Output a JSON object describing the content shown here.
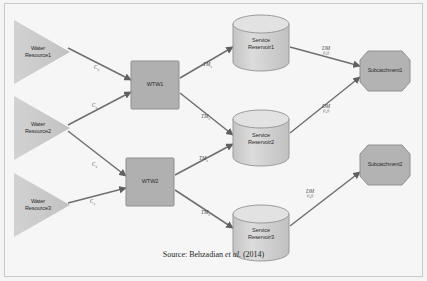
{
  "figure": {
    "caption_prefix": "Source: Behzadian",
    "caption_italic": "et al.",
    "caption_suffix": "(2014)"
  },
  "colors": {
    "page_background": "#f4f4f4",
    "frame_border": "#c9c9c9",
    "shape_fill": "#b3b3b3",
    "shape_stroke": "#8a8a8a",
    "triangle_fill": "#cdcdcd",
    "cylinder_fill": "#cfcfcf",
    "edge_stroke": "#6f6f6f",
    "label_text": "#2b2b2b"
  },
  "nodes": {
    "resources": [
      {
        "id": "water-resource-1",
        "line1": "Water",
        "line2": "Resource1",
        "cx": 44,
        "cy": 52
      },
      {
        "id": "water-resource-2",
        "line1": "Water",
        "line2": "Resource2",
        "cx": 44,
        "cy": 128
      },
      {
        "id": "water-resource-3",
        "line1": "Water",
        "line2": "Resource3",
        "cx": 44,
        "cy": 205
      }
    ],
    "treatment_works": [
      {
        "id": "wtw-1",
        "label": "WTW1",
        "cx": 155,
        "cy": 85
      },
      {
        "id": "wtw-2",
        "label": "WTW2",
        "cx": 150,
        "cy": 182
      }
    ],
    "service_reservoirs": [
      {
        "id": "service-reservoir-1",
        "line1": "Service",
        "line2": "Reservoir1",
        "cx": 261,
        "cy": 44
      },
      {
        "id": "service-reservoir-2",
        "line1": "Service",
        "line2": "Reservoir2",
        "cx": 261,
        "cy": 139
      },
      {
        "id": "service-reservoir-3",
        "line1": "Service",
        "line2": "Reservoir3",
        "cx": 261,
        "cy": 234
      }
    ],
    "subcatchments": [
      {
        "id": "subcatchment-1",
        "label": "Subcatchment1",
        "cx": 385,
        "cy": 71
      },
      {
        "id": "subcatchment-2",
        "label": "Subcatchment2",
        "cx": 385,
        "cy": 165
      }
    ]
  },
  "edges": {
    "supply_labels": [
      {
        "id": "c-1",
        "main": "C",
        "sub": "s",
        "x": 94,
        "y": 64
      },
      {
        "id": "c-2",
        "main": "C",
        "sub": "s",
        "x": 92,
        "y": 102
      },
      {
        "id": "c-3",
        "main": "C",
        "sub": "s",
        "x": 92,
        "y": 161
      },
      {
        "id": "c-4",
        "main": "C",
        "sub": "s",
        "x": 90,
        "y": 198
      }
    ],
    "transfer_labels": [
      {
        "id": "tm-1",
        "main": "TM",
        "sub": "s",
        "x": 203,
        "y": 61
      },
      {
        "id": "tm-2",
        "main": "TM",
        "sub": "s",
        "x": 201,
        "y": 113
      },
      {
        "id": "tm-3",
        "main": "TM",
        "sub": "s",
        "x": 199,
        "y": 155
      },
      {
        "id": "tm-4",
        "main": "TM",
        "sub": "s",
        "x": 201,
        "y": 209
      }
    ],
    "distribution_labels": [
      {
        "id": "dm-1",
        "main": "DM",
        "sub": "(i,j)",
        "x": 322,
        "y": 45
      },
      {
        "id": "dm-2",
        "main": "DM",
        "sub": "(i,j)",
        "x": 322,
        "y": 103
      },
      {
        "id": "dm-3",
        "main": "DM",
        "sub": "(i,j)",
        "x": 306,
        "y": 188
      }
    ]
  }
}
